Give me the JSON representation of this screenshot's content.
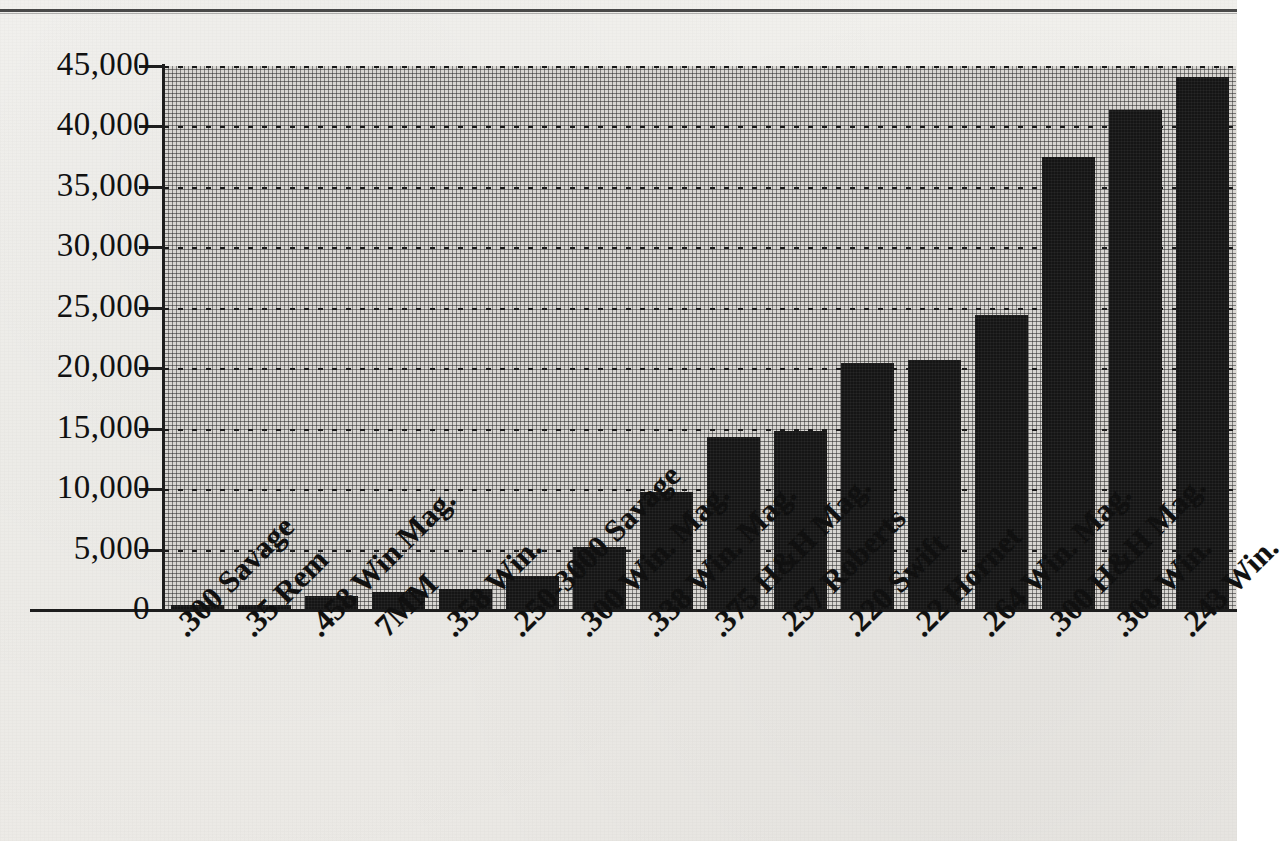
{
  "chart_data": {
    "type": "bar",
    "title": "",
    "xlabel": "",
    "ylabel": "",
    "ylim": [
      0,
      45000
    ],
    "ytick_step": 5000,
    "grid": true,
    "legend": "none",
    "bar_color": "#151515",
    "plot_background": "#d8d6d2",
    "axis_color": "#1d1d1d",
    "ytick_labels": [
      "45,000",
      "40,000",
      "35,000",
      "30,000",
      "25,000",
      "20,000",
      "15,000",
      "10,000",
      "5,000",
      "0"
    ],
    "ytick_values": [
      45000,
      40000,
      35000,
      30000,
      25000,
      20000,
      15000,
      10000,
      5000,
      0
    ],
    "categories": [
      ".300 Savage",
      ".35 Rem",
      ".458 Win Mag.",
      "7MM",
      ".358 Win.",
      ".250-3000 Savage",
      ".300 Win. Mag.",
      ".338 Win. Mag.",
      ".375 H&H Mag.",
      ".257 Roberts",
      ".220 Swift",
      ".22 Hornet",
      ".264 Win. Mag.",
      ".300 H&H Mag.",
      ".308 Win.",
      ".243 Win."
    ],
    "values": [
      400,
      450,
      1200,
      1500,
      1700,
      2800,
      5200,
      9800,
      14300,
      14800,
      20400,
      20700,
      24400,
      37500,
      41400,
      44100
    ]
  },
  "page": {
    "top_rule": "",
    "background_note": ""
  }
}
